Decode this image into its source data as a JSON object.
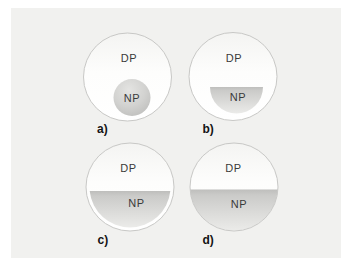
{
  "figure": {
    "panels": [
      {
        "label": "a)",
        "dp": "DP",
        "np": "NP"
      },
      {
        "label": "b)",
        "dp": "DP",
        "np": "NP"
      },
      {
        "label": "c)",
        "dp": "DP",
        "np": "NP"
      },
      {
        "label": "d)",
        "dp": "DP",
        "np": "NP"
      }
    ],
    "colors": {
      "canvas": "#ffffff",
      "panel_background": "#f1f1ef",
      "droplet_tint_top": "#f4f4f2",
      "droplet_fill": "#ffffff",
      "droplet_border": "#c8c8c6",
      "np_gray_dark": "#bebebc",
      "np_gray_mid": "#cbcbc9",
      "np_gray_light": "#ebebe9",
      "np_sphere_highlight": "#e4e4e2",
      "np_sphere_mid": "#d2d2d0",
      "np_sphere_shadow": "#bdbdbb",
      "phase_text": "#3a3a3a",
      "caption_text": "#141414"
    }
  }
}
